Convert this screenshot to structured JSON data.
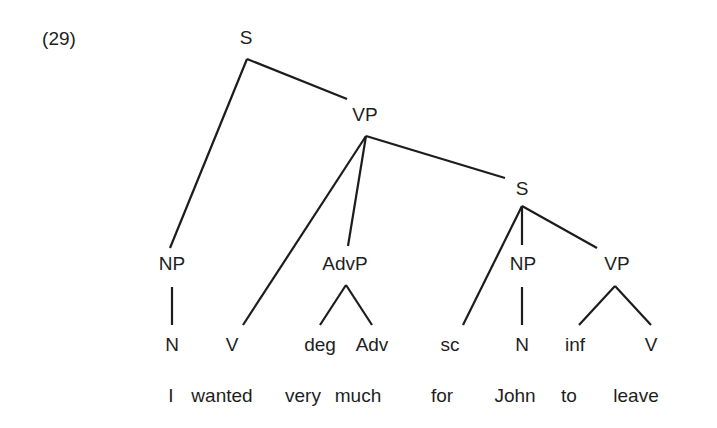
{
  "example": {
    "number_label": "(29)"
  },
  "tree": {
    "nodes": {
      "s_root": {
        "label": "S",
        "x": 246,
        "y": 37
      },
      "vp_main": {
        "label": "VP",
        "x": 365,
        "y": 114
      },
      "s_embedded": {
        "label": "S",
        "x": 522,
        "y": 188
      },
      "np_subject": {
        "label": "NP",
        "x": 172,
        "y": 263
      },
      "advp": {
        "label": "AdvP",
        "x": 345,
        "y": 263
      },
      "np_john": {
        "label": "NP",
        "x": 523,
        "y": 263
      },
      "vp_inf": {
        "label": "VP",
        "x": 617,
        "y": 263
      },
      "n_subject": {
        "label": "N",
        "x": 172,
        "y": 344
      },
      "v_main": {
        "label": "V",
        "x": 232,
        "y": 344
      },
      "deg": {
        "label": "deg",
        "x": 320,
        "y": 344
      },
      "adv": {
        "label": "Adv",
        "x": 372,
        "y": 344
      },
      "sc": {
        "label": "sc",
        "x": 450,
        "y": 344
      },
      "n_john": {
        "label": "N",
        "x": 522,
        "y": 344
      },
      "inf": {
        "label": "inf",
        "x": 575,
        "y": 344
      },
      "v_leave": {
        "label": "V",
        "x": 651,
        "y": 344
      }
    },
    "edges": [
      {
        "from": "s_root",
        "to": "np_subject",
        "x1": 247,
        "y1": 59,
        "x2": 170,
        "y2": 248
      },
      {
        "from": "s_root",
        "to": "vp_main",
        "x1": 247,
        "y1": 59,
        "x2": 347,
        "y2": 99
      },
      {
        "from": "vp_main",
        "to": "v_main",
        "x1": 366,
        "y1": 136,
        "x2": 243,
        "y2": 325
      },
      {
        "from": "vp_main",
        "to": "advp",
        "x1": 366,
        "y1": 136,
        "x2": 348,
        "y2": 246
      },
      {
        "from": "vp_main",
        "to": "s_embedded",
        "x1": 366,
        "y1": 136,
        "x2": 505,
        "y2": 178
      },
      {
        "from": "s_embedded",
        "to": "sc",
        "x1": 522,
        "y1": 206,
        "x2": 463,
        "y2": 325
      },
      {
        "from": "s_embedded",
        "to": "np_john",
        "x1": 522,
        "y1": 206,
        "x2": 522,
        "y2": 245
      },
      {
        "from": "s_embedded",
        "to": "vp_inf",
        "x1": 522,
        "y1": 206,
        "x2": 597,
        "y2": 248
      },
      {
        "from": "np_subject",
        "to": "n_subject",
        "x1": 172,
        "y1": 287,
        "x2": 172,
        "y2": 325
      },
      {
        "from": "advp",
        "to": "deg",
        "x1": 346,
        "y1": 285,
        "x2": 320,
        "y2": 325
      },
      {
        "from": "advp",
        "to": "adv",
        "x1": 346,
        "y1": 285,
        "x2": 372,
        "y2": 325
      },
      {
        "from": "np_john",
        "to": "n_john",
        "x1": 522,
        "y1": 287,
        "x2": 522,
        "y2": 325
      },
      {
        "from": "vp_inf",
        "to": "inf",
        "x1": 615,
        "y1": 286,
        "x2": 579,
        "y2": 325
      },
      {
        "from": "vp_inf",
        "to": "v_leave",
        "x1": 615,
        "y1": 286,
        "x2": 651,
        "y2": 325
      }
    ]
  },
  "sentence": {
    "words": [
      {
        "text": "I",
        "x": 171,
        "y": 395
      },
      {
        "text": "wanted",
        "x": 222,
        "y": 395
      },
      {
        "text": "very",
        "x": 303,
        "y": 395
      },
      {
        "text": "much",
        "x": 358,
        "y": 395
      },
      {
        "text": "for",
        "x": 442,
        "y": 395
      },
      {
        "text": "John",
        "x": 515,
        "y": 395
      },
      {
        "text": "to",
        "x": 569,
        "y": 395
      },
      {
        "text": "leave",
        "x": 636,
        "y": 395
      }
    ]
  },
  "colors": {
    "background": "#ffffff",
    "ink": "#1e1e1e",
    "line": "#1c1c1c"
  }
}
